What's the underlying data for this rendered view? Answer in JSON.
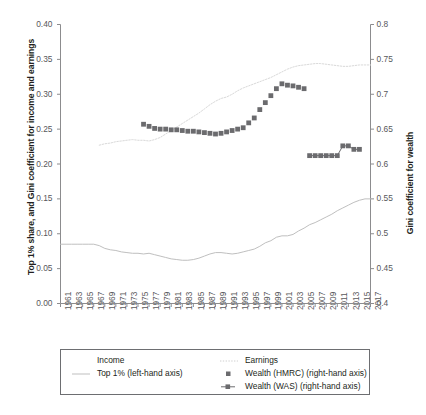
{
  "axes": {
    "left_title": "Top 1% share, and Gini coefficient for income and earnings",
    "right_title": "Gini coefficient for wealth",
    "left_ticks": [
      "0.00",
      "0.05",
      "0.10",
      "0.15",
      "0.20",
      "0.25",
      "0.30",
      "0.35",
      "0.40"
    ],
    "right_ticks": [
      "0.4",
      "0.45",
      "0.5",
      "0.55",
      "0.6",
      "0.65",
      "0.7",
      "0.75",
      "0.8"
    ],
    "x_ticks": [
      "1961",
      "1963",
      "1965",
      "1967",
      "1969",
      "1971",
      "1973",
      "1975",
      "1977",
      "1979",
      "1981",
      "1983",
      "1985",
      "1987",
      "1989",
      "1991",
      "1993",
      "1995",
      "1997",
      "1999",
      "2001",
      "2003",
      "2005",
      "2007",
      "2009",
      "2011",
      "2013",
      "2015",
      "2017"
    ]
  },
  "legend": {
    "col1_header": "Income",
    "col1_item1": "Top 1% (left-hand axis)",
    "col2_header": "Earnings",
    "col2_item1": "Wealth (HMRC) (right-hand axis)",
    "col2_item2": "Wealth (WAS) (right-hand axis)"
  },
  "caption": "",
  "colors": {
    "income_line": "#bfbfbf",
    "earnings_line": "#d9d9d9",
    "wealth_marker": "#6b6b6e",
    "axis": "#8c8c8e",
    "text": "#231f20"
  },
  "chart_data": {
    "type": "line",
    "title": "",
    "xlabel": "",
    "ylabel": "Top 1% share, and Gini coefficient for income and earnings",
    "y2label": "Gini coefficient for wealth",
    "xlim": [
      1961,
      2017
    ],
    "ylim": [
      0.0,
      0.4
    ],
    "y2lim": [
      0.4,
      0.8
    ],
    "grid": false,
    "legend_position": "below-axes",
    "series": [
      {
        "name": "Top 1% (left-hand axis)",
        "axis": "left",
        "style": "solid-line",
        "color": "#bfbfbf",
        "x": [
          1961,
          1962,
          1963,
          1964,
          1965,
          1966,
          1967,
          1968,
          1969,
          1970,
          1971,
          1972,
          1973,
          1974,
          1975,
          1976,
          1977,
          1978,
          1979,
          1980,
          1981,
          1982,
          1983,
          1984,
          1985,
          1986,
          1987,
          1988,
          1989,
          1990,
          1991,
          1992,
          1993,
          1994,
          1995,
          1996,
          1997,
          1998,
          1999,
          2000,
          2001,
          2002,
          2003,
          2004,
          2005,
          2006,
          2007,
          2008,
          2009,
          2010,
          2011,
          2012,
          2013,
          2014,
          2015,
          2016,
          2017
        ],
        "y": [
          0.085,
          0.085,
          0.085,
          0.085,
          0.085,
          0.085,
          0.085,
          0.083,
          0.079,
          0.077,
          0.076,
          0.074,
          0.073,
          0.072,
          0.072,
          0.071,
          0.072,
          0.07,
          0.068,
          0.066,
          0.064,
          0.063,
          0.062,
          0.062,
          0.063,
          0.065,
          0.068,
          0.071,
          0.073,
          0.073,
          0.072,
          0.071,
          0.072,
          0.074,
          0.076,
          0.078,
          0.082,
          0.087,
          0.09,
          0.095,
          0.097,
          0.097,
          0.099,
          0.104,
          0.108,
          0.113,
          0.116,
          0.12,
          0.124,
          0.128,
          0.133,
          0.137,
          0.141,
          0.145,
          0.148,
          0.15,
          0.15
        ]
      },
      {
        "name": "Earnings (right-hand axis)",
        "axis": "right",
        "style": "dotted-line",
        "color": "#d9d9d9",
        "x": [
          1968,
          1969,
          1970,
          1971,
          1972,
          1973,
          1974,
          1975,
          1976,
          1977,
          1978,
          1979,
          1980,
          1981,
          1982,
          1983,
          1984,
          1985,
          1986,
          1987,
          1988,
          1989,
          1990,
          1991,
          1992,
          1993,
          1994,
          1995,
          1996,
          1997,
          1998,
          1999,
          2000,
          2001,
          2002,
          2003,
          2004,
          2005,
          2006,
          2007,
          2008,
          2009,
          2010,
          2011,
          2012,
          2013,
          2014,
          2015,
          2016,
          2017
        ],
        "y": [
          0.627,
          0.629,
          0.63,
          0.632,
          0.633,
          0.634,
          0.635,
          0.634,
          0.634,
          0.633,
          0.635,
          0.638,
          0.643,
          0.648,
          0.653,
          0.658,
          0.663,
          0.668,
          0.673,
          0.679,
          0.685,
          0.69,
          0.694,
          0.696,
          0.7,
          0.705,
          0.709,
          0.712,
          0.715,
          0.718,
          0.721,
          0.724,
          0.728,
          0.732,
          0.736,
          0.739,
          0.741,
          0.742,
          0.743,
          0.744,
          0.744,
          0.743,
          0.742,
          0.741,
          0.74,
          0.74,
          0.741,
          0.742,
          0.742,
          0.742
        ]
      },
      {
        "name": "Wealth (HMRC) (right-hand axis)",
        "axis": "right",
        "style": "square-markers",
        "color": "#6b6b6e",
        "x": [
          1976,
          1977,
          1978,
          1979,
          1980,
          1981,
          1982,
          1983,
          1984,
          1985,
          1986,
          1987,
          1988,
          1989,
          1990,
          1991,
          1992,
          1993,
          1994,
          1995,
          1996,
          1997,
          1998,
          1999,
          2000,
          2001,
          2002,
          2003,
          2004,
          2005
        ],
        "y": [
          0.657,
          0.654,
          0.651,
          0.65,
          0.65,
          0.649,
          0.649,
          0.648,
          0.647,
          0.647,
          0.646,
          0.645,
          0.644,
          0.643,
          0.644,
          0.646,
          0.648,
          0.65,
          0.652,
          0.659,
          0.666,
          0.678,
          0.688,
          0.698,
          0.708,
          0.715,
          0.713,
          0.712,
          0.71,
          0.708
        ]
      },
      {
        "name": "Wealth (WAS) (right-hand axis)",
        "axis": "right",
        "style": "square-markers-line",
        "color": "#6b6b6e",
        "x": [
          2006,
          2007,
          2008,
          2009,
          2010,
          2011,
          2012,
          2013,
          2014,
          2015
        ],
        "y": [
          0.612,
          0.612,
          0.612,
          0.612,
          0.612,
          0.612,
          0.626,
          0.626,
          0.621,
          0.621
        ]
      }
    ]
  }
}
